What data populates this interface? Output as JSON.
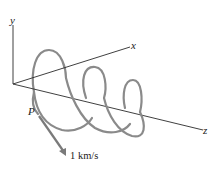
{
  "diagram": {
    "axes": {
      "x_label": "x",
      "y_label": "y",
      "z_label": "z"
    },
    "point_label": "P",
    "velocity_label": "1 km/s",
    "colors": {
      "axis": "#2a2a2a",
      "helix": "#8a8a8a",
      "arrow": "#7a7a7a",
      "text": "#222222"
    }
  }
}
